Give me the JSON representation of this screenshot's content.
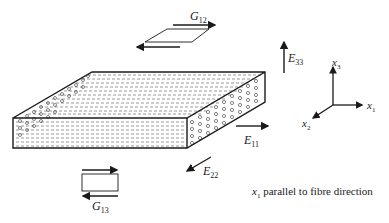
{
  "diagram": {
    "labels": {
      "g12": {
        "main": "G",
        "sub": "12"
      },
      "e33": {
        "main": "E",
        "sub": "33"
      },
      "e11": {
        "main": "E",
        "sub": "11"
      },
      "e22": {
        "main": "E",
        "sub": "22"
      },
      "g13": {
        "main": "G",
        "sub": "13"
      },
      "x1": {
        "main": "x",
        "sub": "1"
      },
      "x2": {
        "main": "x",
        "sub": "2"
      },
      "x3": {
        "main": "x",
        "sub": "3"
      }
    },
    "caption": {
      "var": "x",
      "sub": "1",
      "text": " parallel to fibre direction"
    },
    "colors": {
      "line": "#1a1a1a",
      "fibre": "#555555"
    }
  }
}
